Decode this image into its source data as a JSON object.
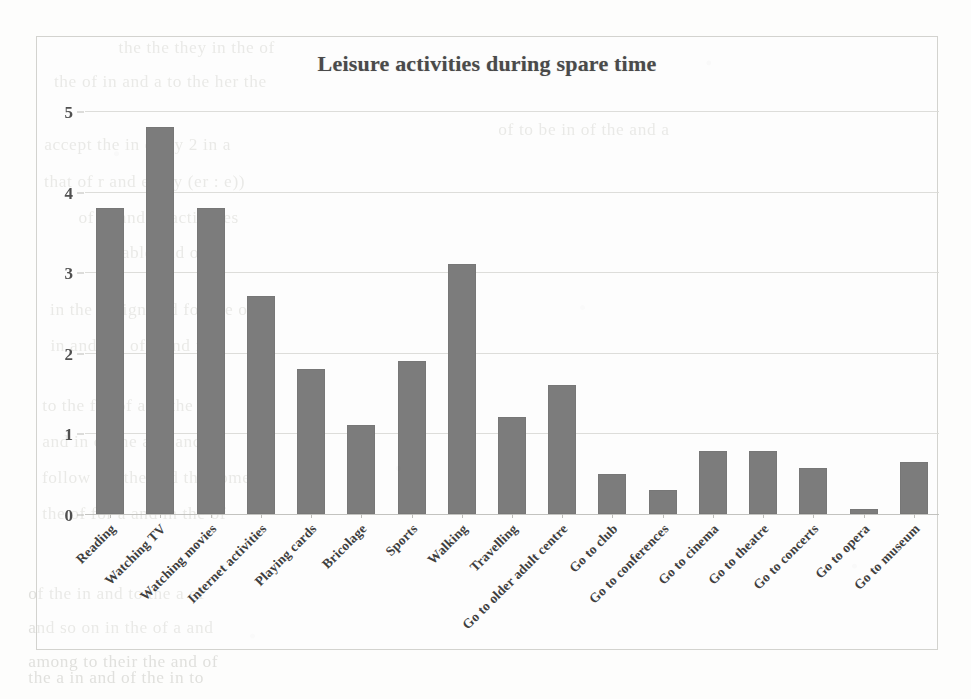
{
  "chart_data": {
    "type": "bar",
    "title": "Leisure activities during spare time",
    "xlabel": "",
    "ylabel": "",
    "ylim": [
      0,
      5
    ],
    "yticks": [
      0,
      1,
      2,
      3,
      4,
      5
    ],
    "grid": true,
    "legend": false,
    "orientation": "vertical",
    "bar_color": "#7c7c7c",
    "categories": [
      "Reading",
      "Watching TV",
      "Watching movies",
      "Internet activities",
      "Playing cards",
      "Bricolage",
      "Sports",
      "Walking",
      "Travelling",
      "Go to older adult centre",
      "Go to club",
      "Go to conferences",
      "Go to cinema",
      "Go to theatre",
      "Go to concerts",
      "Go to opera",
      "Go to museum"
    ],
    "values": [
      3.8,
      4.8,
      3.8,
      2.7,
      1.8,
      1.1,
      1.9,
      3.1,
      1.2,
      1.6,
      0.5,
      0.3,
      0.78,
      0.78,
      0.57,
      0.06,
      0.65
    ]
  },
  "background": {
    "note": "scanned book page with faint bleed-through text from reverse side",
    "ghost_lines": [
      "the the they in the of",
      "the of in and a to the her the",
      "accept the  in  of  by 2  in a",
      "that of r    and every (er : e))",
      "of  in  and  in  activities",
      "stable and one",
      "in  the  design  and  for  the  of",
      "in  and  the  of  a  and  in",
      "to  the  for  of  a  in  the  and",
      "and  in  of  the  a  in  and  all",
      "follow  the  the  and  the  some",
      "the  of  for  a  and  in  the  of",
      "of  the  in  and  to  the  a  of",
      "and  so  on  in  the  of  a  and",
      "among  to  their  the  and  of",
      "the  a  in  and  of  the  in  to",
      "of  to  be  in  of  the  and  a"
    ]
  }
}
